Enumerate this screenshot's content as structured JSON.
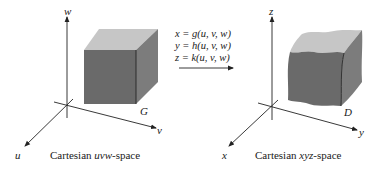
{
  "left_space": {
    "caption_prefix": "Cartesian ",
    "caption_vars": "uvw",
    "caption_suffix": "-space",
    "axes": {
      "vertical": "w",
      "horizontal": "v",
      "depth": "u"
    },
    "region_label": "G"
  },
  "right_space": {
    "caption_prefix": "Cartesian ",
    "caption_vars": "xyz",
    "caption_suffix": "-space",
    "axes": {
      "vertical": "z",
      "horizontal": "y",
      "depth": "x"
    },
    "region_label": "D"
  },
  "transformation": {
    "equations": [
      "x = g(u, v, w)",
      "y = h(u, v, w)",
      "z = k(u, v, w)"
    ]
  },
  "colors": {
    "front_face": "#6e6e6e",
    "top_face": "#c4c4c4",
    "side_face": "#8a8a8a",
    "axis": "#222222"
  }
}
